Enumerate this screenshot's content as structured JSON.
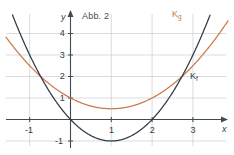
{
  "figure": {
    "title": "Abb. 2",
    "width": 234,
    "height": 155
  },
  "axes": {
    "x_label": "x",
    "y_label": "y",
    "x_ticks": [
      {
        "value": -1,
        "label": "-1"
      },
      {
        "value": 1,
        "label": "1"
      },
      {
        "value": 2,
        "label": "2"
      },
      {
        "value": 3,
        "label": "3"
      }
    ],
    "y_ticks": [
      {
        "value": 4,
        "label": "4"
      },
      {
        "value": 3,
        "label": "3"
      },
      {
        "value": 2,
        "label": "2"
      },
      {
        "value": 1,
        "label": "1"
      },
      {
        "value": -1,
        "label": "-1"
      }
    ],
    "grid": true,
    "xlim": [
      -1.75,
      3.9
    ],
    "ylim": [
      -1.35,
      4.75
    ],
    "axis_color": "#3f4a52",
    "grid_color": "#c9cdd1"
  },
  "curves": [
    {
      "name": "Kg",
      "label_main": "K",
      "label_sub": "g",
      "color": "#c8794a",
      "vertex": [
        1,
        0.5
      ],
      "coefficients": {
        "a": 0.5,
        "b": -1,
        "c": 1
      },
      "label_pos": [
        172,
        11
      ]
    },
    {
      "name": "Kf",
      "label_main": "K",
      "label_sub": "f",
      "color": "#2f3a44",
      "vertex": [
        1,
        -1
      ],
      "coefficients": {
        "a": 1,
        "b": -2,
        "c": 0
      },
      "roots": [
        0,
        2
      ],
      "label_pos": [
        191,
        73
      ]
    }
  ],
  "chart_data": {
    "type": "line",
    "title": "Abb. 2",
    "xlabel": "x",
    "ylabel": "y",
    "xlim": [
      -1.75,
      3.9
    ],
    "ylim": [
      -1.35,
      4.75
    ],
    "grid": true,
    "x": [
      -1.5,
      -1,
      -0.5,
      0,
      0.5,
      1,
      1.5,
      2,
      2.5,
      3,
      3.5
    ],
    "series": [
      {
        "name": "Kf",
        "formula": "f(x) = x^2 - 2x",
        "color": "#2f3a44",
        "values": [
          5.25,
          3,
          1.25,
          0,
          -0.75,
          -1,
          -0.75,
          0,
          1.25,
          3,
          5.25
        ]
      },
      {
        "name": "Kg",
        "formula": "g(x) = 0.5x^2 - x + 1",
        "color": "#c8794a",
        "values": [
          3.625,
          2.5,
          1.625,
          1,
          0.625,
          0.5,
          0.625,
          1,
          1.625,
          2.5,
          3.625
        ]
      }
    ],
    "annotations": [
      {
        "text": "K_g",
        "x": 3.3,
        "y": 4.6
      },
      {
        "text": "K_f",
        "x": 3.8,
        "y": 2.2
      },
      {
        "text": "Abb. 2",
        "x": 0.5,
        "y": 4.7
      }
    ]
  }
}
